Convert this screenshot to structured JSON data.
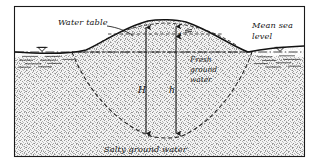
{
  "figure": {
    "frame": {
      "x": 14,
      "y": 6,
      "width": 291,
      "height": 151,
      "border_color": "#1a1a1a"
    }
  },
  "labels": {
    "water_table": "Water table",
    "mean_sea_level_line1": "Mean sea",
    "mean_sea_level_line2": "level",
    "fresh_ground_water_line1": "Fresh",
    "fresh_ground_water_line2": "ground",
    "fresh_ground_water_line3": "water",
    "salty_ground_water": "Salty ground water",
    "depth_H": "H",
    "depth_h": "h",
    "thickness_t": "t"
  },
  "symbols": {
    "sea_level_marker_left": "sea-level-triangle-left",
    "sea_level_marker_right": "sea-level-triangle-right",
    "leader_line": "water-table-leader-line"
  },
  "colors": {
    "ink": "#1a1a1a",
    "ground_stipple": "#8c8c8c",
    "ground_fill": "#f2f2f2",
    "sea_fill": "#ffffff",
    "dashed_interface": "#262626",
    "paper": "#ffffff"
  },
  "geometry": {
    "sea_level_y": 52,
    "water_table_peak_x": 166,
    "water_table_peak_y": 20,
    "lens_bottom_y": 137,
    "arrow_H_x": 146,
    "arrow_h_x": 176
  }
}
